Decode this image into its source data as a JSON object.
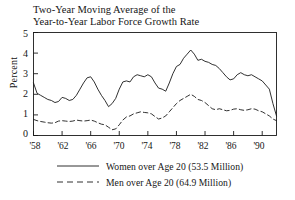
{
  "chart_data": {
    "type": "line",
    "title": "Two-Year Moving Average of the Year-to-Year Labor Force Growth Rate",
    "title_lines": [
      "Two-Year Moving Average of the",
      "Year-to-Year Labor Force Growth Rate"
    ],
    "xlabel": "",
    "ylabel": "Percent",
    "ylim": [
      0,
      5
    ],
    "xlim": [
      1958,
      1992
    ],
    "grid": false,
    "legend_position": "below-plot",
    "ytick_labels": [
      "0",
      "1",
      "2",
      "3",
      "4",
      "5"
    ],
    "ytick_values": [
      0,
      1,
      2,
      3,
      4,
      5
    ],
    "xtick_labels": [
      "'58",
      "'62",
      "'66",
      "'70",
      "'74",
      "'78",
      "'82",
      "'86",
      "'90"
    ],
    "xtick_values": [
      1958,
      1962,
      1966,
      1970,
      1974,
      1978,
      1982,
      1986,
      1990
    ],
    "series": [
      {
        "name": "Women over Age 20 (53.5 Million)",
        "short_name": "Women over Age 20",
        "population": "53.5 Million",
        "style": "solid",
        "color": "#1a1a1a",
        "x": [
          1958,
          1958.5,
          1959,
          1959.5,
          1960,
          1960.5,
          1961,
          1961.5,
          1962,
          1962.5,
          1963,
          1963.5,
          1964,
          1964.5,
          1965,
          1965.5,
          1966,
          1966.5,
          1967,
          1967.5,
          1968,
          1968.5,
          1969,
          1969.5,
          1970,
          1970.5,
          1971,
          1971.5,
          1972,
          1972.5,
          1973,
          1973.5,
          1974,
          1974.5,
          1975,
          1975.5,
          1976,
          1976.5,
          1977,
          1977.5,
          1978,
          1978.5,
          1979,
          1979.5,
          1980,
          1980.5,
          1981,
          1981.5,
          1982,
          1982.5,
          1983,
          1983.5,
          1984,
          1984.5,
          1985,
          1985.5,
          1986,
          1986.5,
          1987,
          1987.5,
          1988,
          1988.5,
          1989,
          1989.5,
          1990,
          1990.5,
          1991,
          1991.5,
          1992
        ],
        "values": [
          2.55,
          2.05,
          1.95,
          1.85,
          1.75,
          1.7,
          1.6,
          1.65,
          1.85,
          1.8,
          1.7,
          1.75,
          1.95,
          2.25,
          2.55,
          2.8,
          2.85,
          2.6,
          2.25,
          1.95,
          1.7,
          1.4,
          1.55,
          1.8,
          2.25,
          2.6,
          2.65,
          2.6,
          2.85,
          2.95,
          2.9,
          2.85,
          2.95,
          2.85,
          2.55,
          2.3,
          2.25,
          2.15,
          2.55,
          3.0,
          3.35,
          3.45,
          3.75,
          3.95,
          4.15,
          3.95,
          3.65,
          3.7,
          3.6,
          3.55,
          3.45,
          3.4,
          3.25,
          3.05,
          2.85,
          2.7,
          2.75,
          2.95,
          3.05,
          2.95,
          2.9,
          2.95,
          2.85,
          2.75,
          2.65,
          2.45,
          2.25,
          1.55,
          0.95
        ]
      },
      {
        "name": "Men over Age 20 (64.9 Million)",
        "short_name": "Men over Age 20",
        "population": "64.9 Million",
        "style": "dashed",
        "color": "#1a1a1a",
        "x": [
          1958,
          1958.5,
          1959,
          1959.5,
          1960,
          1960.5,
          1961,
          1961.5,
          1962,
          1962.5,
          1963,
          1963.5,
          1964,
          1964.5,
          1965,
          1965.5,
          1966,
          1966.5,
          1967,
          1967.5,
          1968,
          1968.5,
          1969,
          1969.5,
          1970,
          1970.5,
          1971,
          1971.5,
          1972,
          1972.5,
          1973,
          1973.5,
          1974,
          1974.5,
          1975,
          1975.5,
          1976,
          1976.5,
          1977,
          1977.5,
          1978,
          1978.5,
          1979,
          1979.5,
          1980,
          1980.5,
          1981,
          1981.5,
          1982,
          1982.5,
          1983,
          1983.5,
          1984,
          1984.5,
          1985,
          1985.5,
          1986,
          1986.5,
          1987,
          1987.5,
          1988,
          1988.5,
          1989,
          1989.5,
          1990,
          1990.5,
          1991,
          1991.5,
          1992
        ],
        "values": [
          0.78,
          0.72,
          0.68,
          0.65,
          0.62,
          0.6,
          0.62,
          0.7,
          0.72,
          0.7,
          0.68,
          0.7,
          0.75,
          0.72,
          0.7,
          0.72,
          0.75,
          0.7,
          0.62,
          0.55,
          0.52,
          0.4,
          0.28,
          0.32,
          0.52,
          0.75,
          0.9,
          0.95,
          1.05,
          1.1,
          1.15,
          1.12,
          1.1,
          1.05,
          0.92,
          0.8,
          0.85,
          0.95,
          1.15,
          1.35,
          1.55,
          1.7,
          1.8,
          1.9,
          2.0,
          1.9,
          1.75,
          1.7,
          1.6,
          1.45,
          1.3,
          1.25,
          1.3,
          1.25,
          1.2,
          1.22,
          1.28,
          1.3,
          1.25,
          1.22,
          1.25,
          1.3,
          1.28,
          1.2,
          1.15,
          1.05,
          0.95,
          0.8,
          0.72
        ]
      }
    ]
  }
}
